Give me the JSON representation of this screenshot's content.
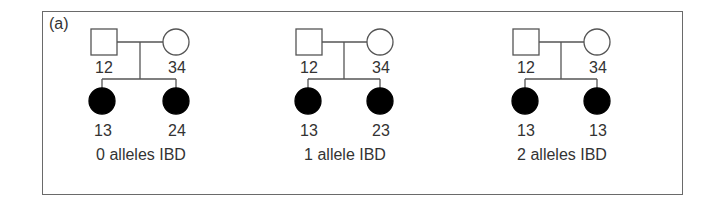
{
  "figure": {
    "panel_label": "(a)",
    "line_color": "#555555",
    "affected_fill": "#000000",
    "pedigrees": [
      {
        "father": {
          "genotype": "12",
          "shape": "square",
          "affected": false
        },
        "mother": {
          "genotype": "34",
          "shape": "circle",
          "affected": false
        },
        "children": [
          {
            "genotype": "13",
            "shape": "circle",
            "affected": true
          },
          {
            "genotype": "24",
            "shape": "circle",
            "affected": true
          }
        ],
        "caption": "0 alleles IBD"
      },
      {
        "father": {
          "genotype": "12",
          "shape": "square",
          "affected": false
        },
        "mother": {
          "genotype": "34",
          "shape": "circle",
          "affected": false
        },
        "children": [
          {
            "genotype": "13",
            "shape": "circle",
            "affected": true
          },
          {
            "genotype": "23",
            "shape": "circle",
            "affected": true
          }
        ],
        "caption": "1 allele IBD"
      },
      {
        "father": {
          "genotype": "12",
          "shape": "square",
          "affected": false
        },
        "mother": {
          "genotype": "34",
          "shape": "circle",
          "affected": false
        },
        "children": [
          {
            "genotype": "13",
            "shape": "circle",
            "affected": true
          },
          {
            "genotype": "13",
            "shape": "circle",
            "affected": true
          }
        ],
        "caption": "2 alleles IBD"
      }
    ]
  }
}
